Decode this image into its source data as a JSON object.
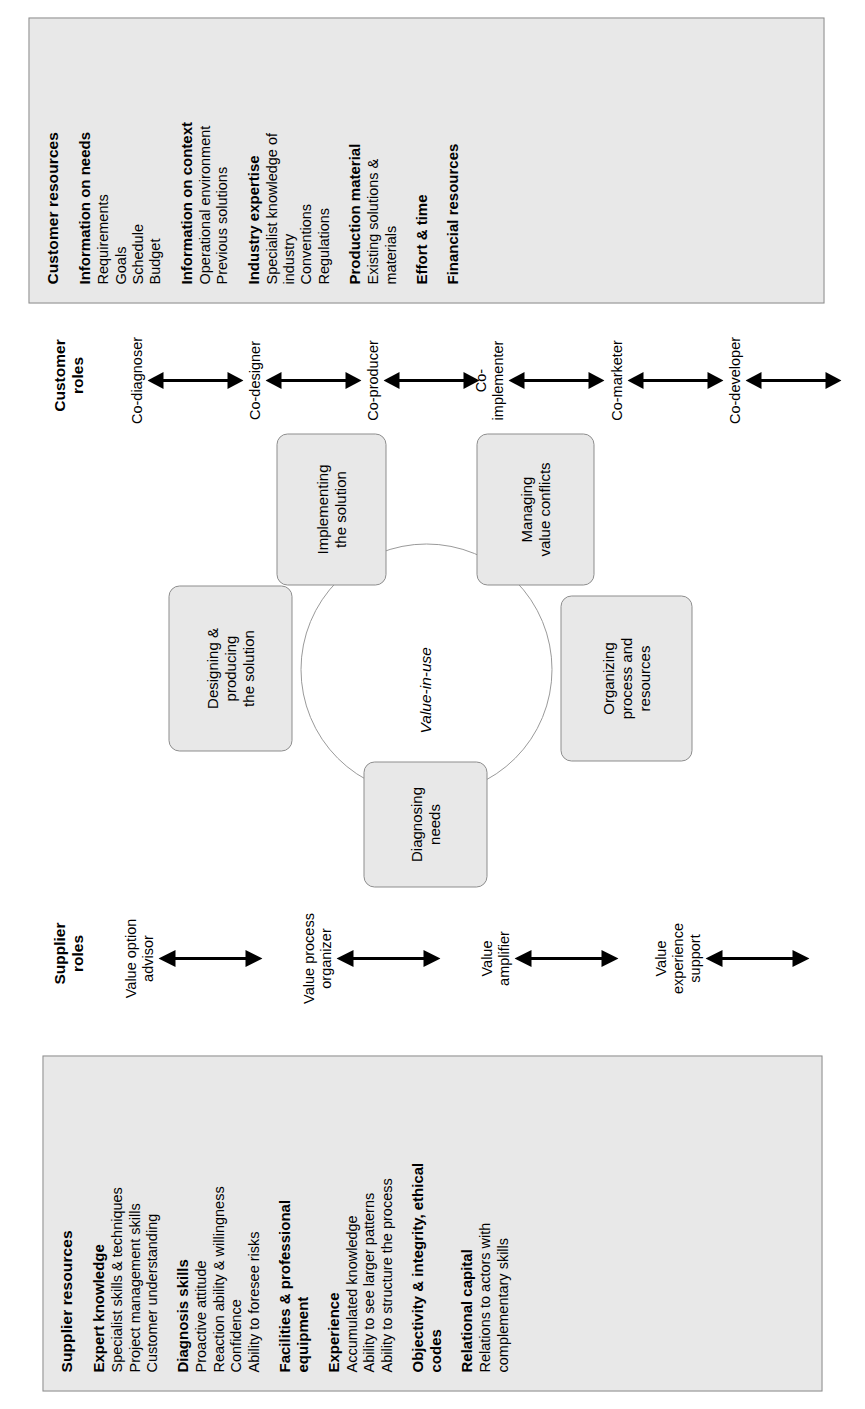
{
  "supplier_panel": {
    "title": "Supplier resources",
    "groups": [
      {
        "heading": "Expert knowledge",
        "items": [
          "Specialist skills & techniques",
          "Project management skills",
          "Customer understanding"
        ]
      },
      {
        "heading": "Diagnosis skills",
        "items": [
          "Proactive attitude",
          "Reaction ability & willingness",
          "Confidence",
          "Ability to foresee risks"
        ]
      },
      {
        "heading": "Facilities & professional equipment",
        "items": []
      },
      {
        "heading": "Experience",
        "items": [
          "Accumulated knowledge",
          "Ability to see larger patterns",
          "Ability to structure the process"
        ]
      },
      {
        "heading": "Objectivity & integrity, ethical codes",
        "items": []
      },
      {
        "heading": "Relational capital",
        "items": [
          "Relations to actors with complementary skills"
        ]
      }
    ]
  },
  "customer_panel": {
    "title": "Customer resources",
    "groups": [
      {
        "heading": "Information on needs",
        "items": [
          "Requirements",
          "Goals",
          "Schedule",
          "Budget"
        ]
      },
      {
        "heading": "Information on context",
        "items": [
          "Operational environment",
          "Previous solutions"
        ]
      },
      {
        "heading": "Industry expertise",
        "items": [
          "Specialist knowledge of industry",
          "Conventions",
          "Regulations"
        ]
      },
      {
        "heading": "Production material",
        "items": [
          "Existing solutions & materials"
        ]
      },
      {
        "heading": "Effort & time",
        "items": []
      },
      {
        "heading": "Financial resources",
        "items": []
      }
    ]
  },
  "supplier_roles": {
    "title": "Supplier\nroles",
    "items": [
      {
        "label": "Value option\nadvisor"
      },
      {
        "label": "Value process\norganizer"
      },
      {
        "label": "Value\namplifier"
      },
      {
        "label": "Value\nexperience\nsupport"
      }
    ]
  },
  "customer_roles": {
    "title": "Customer\nroles",
    "items": [
      {
        "label": "Co-diagnoser"
      },
      {
        "label": "Co-designer"
      },
      {
        "label": "Co-producer"
      },
      {
        "label": "Co-\nimplementer"
      },
      {
        "label": "Co-marketer"
      },
      {
        "label": "Co-developer"
      }
    ]
  },
  "wheel": {
    "center_label": "Value-in-use",
    "nodes": [
      {
        "label": "Diagnosing\nneeds"
      },
      {
        "label": "Designing &\nproducing\nthe solution"
      },
      {
        "label": "Implementing\nthe solution"
      },
      {
        "label": "Managing\nvalue conflicts"
      },
      {
        "label": "Organizing\nprocess and\nresources"
      }
    ]
  },
  "colors": {
    "panel_fill": "#e8e8e8",
    "panel_border": "#8d8d8d",
    "node_fill": "#e8e8e8",
    "node_border": "#8d8d8d",
    "ring_stroke": "#9a9a9a",
    "text": "#000000"
  }
}
